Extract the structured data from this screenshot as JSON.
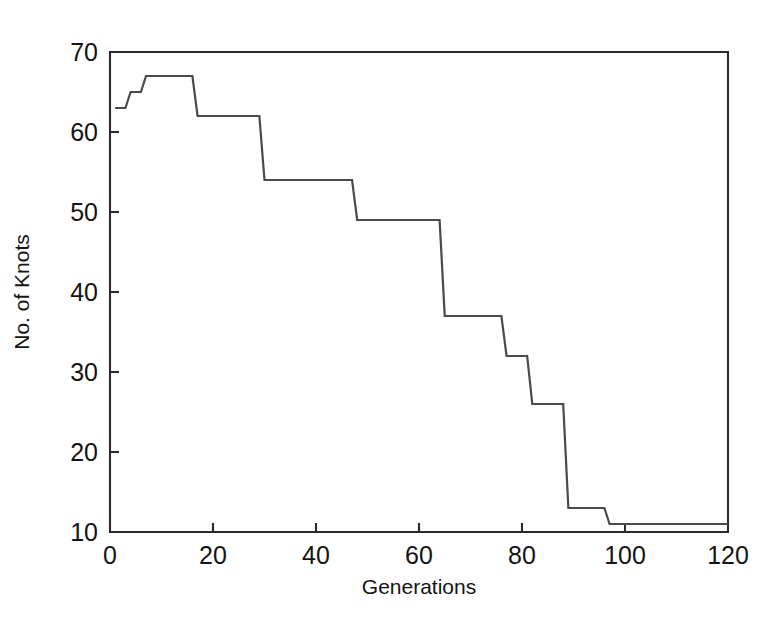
{
  "chart_data": {
    "type": "line",
    "title": "",
    "xlabel": "Generations",
    "ylabel": "No. of Knots",
    "xlim": [
      0,
      120
    ],
    "ylim": [
      10,
      70
    ],
    "xticks": [
      0,
      20,
      40,
      60,
      80,
      100,
      120
    ],
    "yticks": [
      10,
      20,
      30,
      40,
      50,
      60,
      70
    ],
    "grid": false,
    "legend": null,
    "line_style": "step",
    "series": [
      {
        "name": "No. of Knots",
        "x": [
          1,
          3,
          4,
          6,
          7,
          16,
          17,
          29,
          30,
          47,
          48,
          64,
          65,
          76,
          77,
          81,
          82,
          88,
          89,
          96,
          97,
          120
        ],
        "values": [
          63,
          63,
          65,
          65,
          67,
          67,
          62,
          62,
          54,
          54,
          49,
          49,
          37,
          37,
          32,
          32,
          26,
          26,
          13,
          13,
          11,
          11
        ]
      }
    ],
    "annotations": []
  },
  "figure": {
    "axis_color": "#2b2b2b",
    "line_color": "#4a4a4a",
    "background": "#ffffff",
    "tick_labels_y": [
      "70",
      "60",
      "50",
      "40",
      "30",
      "20",
      "10"
    ],
    "tick_labels_x": [
      "0",
      "20",
      "40",
      "60",
      "80",
      "100",
      "120"
    ]
  }
}
